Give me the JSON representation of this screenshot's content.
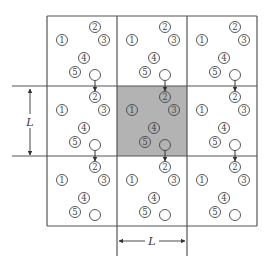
{
  "diagram": {
    "grid": {
      "x0": 47,
      "y0": 16,
      "cell": 70,
      "rows": 3,
      "cols": 3,
      "central_cell": [
        1,
        1
      ]
    },
    "colors": {
      "line": "#555555",
      "circle": "#444444",
      "central_fill": "#b3b3b3",
      "background": "#ffffff"
    },
    "particles": [
      {
        "id": "1",
        "label": "①",
        "dx": 15,
        "dy": 24
      },
      {
        "id": "2",
        "label": "②",
        "dx": 48,
        "dy": 11
      },
      {
        "id": "3",
        "label": "③",
        "dx": 57,
        "dy": 24
      },
      {
        "id": "4",
        "label": "④",
        "dx": 37,
        "dy": 42
      },
      {
        "id": "5",
        "label": "⑤",
        "dx": 28,
        "dy": 56
      },
      {
        "id": "empty",
        "label": "",
        "dx": 48,
        "dy": 59
      }
    ],
    "particle_radius": 5.5,
    "arrows": "open circle moves downward across the cell boundary and reappears as particle 2 in the cell below",
    "dimensions": {
      "vertical": {
        "label": "L",
        "x": 30,
        "y_from": 87,
        "y_to": 157
      },
      "horizontal": {
        "label": "L",
        "y": 241,
        "x_from": 117,
        "x_to": 187
      }
    }
  }
}
